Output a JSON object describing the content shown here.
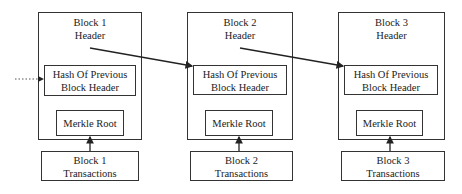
{
  "diagram": {
    "type": "blockchain-structure",
    "blocks": [
      {
        "header_line1": "Block 1",
        "header_line2": "Header",
        "hash_line1": "Hash Of Previous",
        "hash_line2": "Block Header",
        "merkle": "Merkle Root",
        "tx_line1": "Block 1",
        "tx_line2": "Transactions"
      },
      {
        "header_line1": "Block 2",
        "header_line2": "Header",
        "hash_line1": "Hash Of Previous",
        "hash_line2": "Block Header",
        "merkle": "Merkle Root",
        "tx_line1": "Block 2",
        "tx_line2": "Transactions"
      },
      {
        "header_line1": "Block 3",
        "header_line2": "Header",
        "hash_line1": "Hash Of Previous",
        "hash_line2": "Block Header",
        "merkle": "Merkle Root",
        "tx_line1": "Block 3",
        "tx_line2": "Transactions"
      }
    ],
    "connections": [
      {
        "from": "block-1-header",
        "to": "block-2-hash-of-previous"
      },
      {
        "from": "block-2-header",
        "to": "block-3-hash-of-previous"
      },
      {
        "from": "block-n-transactions",
        "to": "block-n-merkle-root"
      },
      {
        "from": "previous-block (dotted)",
        "to": "block-1-hash-of-previous"
      }
    ],
    "colors": {
      "line": "#222222",
      "background": "#ffffff"
    }
  }
}
